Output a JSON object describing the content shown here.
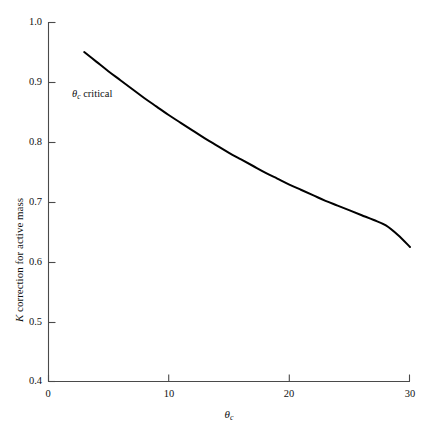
{
  "chart_data": {
    "type": "line",
    "title": "",
    "subtitle": "",
    "xlabel": "θc",
    "xlabel_base": "θ",
    "xlabel_sub": "c",
    "ylabel": "K correction for active mass",
    "ylabel_italic_part": "K",
    "ylabel_rest": " correction for active mass",
    "xlim": [
      0,
      30
    ],
    "ylim": [
      0.4,
      1.0
    ],
    "grid": false,
    "legend": "none",
    "xticks": [
      0,
      10,
      20,
      30
    ],
    "xtick_labels": [
      "0",
      "10",
      "20",
      "30"
    ],
    "yticks": [
      0.4,
      0.5,
      0.6,
      0.7,
      0.8,
      0.9,
      1.0
    ],
    "ytick_labels": [
      "0.4",
      "0.5",
      "0.6",
      "0.7",
      "0.8",
      "0.9",
      "1.0"
    ],
    "tick_direction": "in",
    "line_color": "#000000",
    "line_width": 2.0,
    "axis_color": "#4a4a4a",
    "background": "#ffffff",
    "series": [
      {
        "name": "K correction",
        "x": [
          3,
          4,
          5,
          6,
          7,
          8,
          9,
          10,
          11,
          12,
          13,
          14,
          15,
          16,
          17,
          18,
          19,
          20,
          21,
          22,
          23,
          24,
          25,
          26,
          27,
          28,
          29,
          30
        ],
        "y": [
          0.95,
          0.934,
          0.918,
          0.903,
          0.888,
          0.873,
          0.859,
          0.845,
          0.832,
          0.819,
          0.806,
          0.794,
          0.782,
          0.771,
          0.76,
          0.749,
          0.739,
          0.729,
          0.72,
          0.711,
          0.702,
          0.694,
          0.686,
          0.678,
          0.67,
          0.661,
          0.645,
          0.625
        ]
      }
    ],
    "annotations": [
      {
        "name": "theta-c-critical",
        "text": "θc critical",
        "base": "θ",
        "sub": "c",
        "rest": " critical",
        "x_px": 72,
        "y_px": 89
      }
    ]
  },
  "axes": {
    "plot_left_px": 48,
    "plot_right_px": 410,
    "plot_top_px": 22,
    "plot_bottom_px": 382
  }
}
